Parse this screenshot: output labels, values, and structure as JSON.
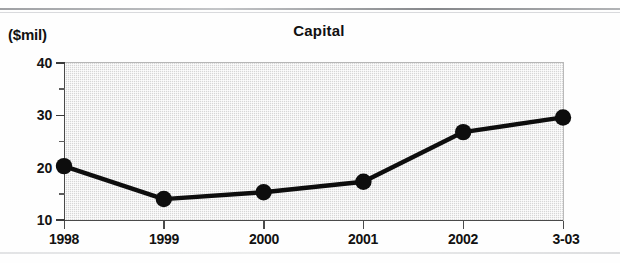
{
  "figure": {
    "title": "Capital",
    "y_unit_label": "($mil)"
  },
  "axes": {
    "y_major_ticks": [
      "10",
      "20",
      "30",
      "40"
    ],
    "y_minor_ticks": [
      "15",
      "25",
      "35"
    ],
    "x_tick_labels": [
      "1998",
      "1999",
      "2000",
      "2001",
      "2002",
      "3-03"
    ]
  },
  "style": {
    "line_color": "#0d0d0d",
    "marker_color": "#0d0d0d",
    "plot_background": "#d6d6d6",
    "axis_color": "#4a4a4a",
    "text_color": "#121212"
  },
  "chart_data": {
    "type": "line",
    "title": "Capital",
    "xlabel": "",
    "ylabel": "($mil)",
    "categories": [
      "1998",
      "1999",
      "2000",
      "2001",
      "2002",
      "3-03"
    ],
    "values": [
      20.3,
      14.0,
      15.3,
      17.3,
      26.8,
      29.6
    ],
    "series": [
      {
        "name": "Capital",
        "values": [
          20.3,
          14.0,
          15.3,
          17.3,
          26.8,
          29.6
        ]
      }
    ],
    "ylim": [
      10,
      40
    ],
    "y_major_tick_values": [
      10,
      20,
      30,
      40
    ],
    "y_minor_tick_values": [
      15,
      25,
      35
    ],
    "grid": false,
    "legend": "none",
    "markers": "filled-circle",
    "units": "$ millions"
  }
}
